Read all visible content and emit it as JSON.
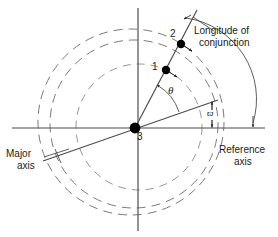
{
  "figure": {
    "type": "orbital-geometry-diagram",
    "colors": {
      "line": "#4d4d4d",
      "dash": "#6e6e6e",
      "text": "#1a1a1a",
      "marker": "#000000",
      "background": "#ffffff"
    }
  },
  "labels": {
    "point_1": "1",
    "point_2": "2",
    "point_3": "3",
    "theta": "θ",
    "omega_bar": "ϖ",
    "longitude_of_conjunction_line1": "Longitude of",
    "longitude_of_conjunction_line2": "conjunction",
    "reference_axis_line1": "Reference",
    "reference_axis_line2": "axis",
    "major_axis_line1": "Major",
    "major_axis_line2": "axis"
  },
  "geometry": {
    "center": {
      "x": 135,
      "y": 128
    },
    "reference_axis": {
      "x1": 12,
      "y1": 128,
      "x2": 265,
      "y2": 128
    },
    "vertical_axis": {
      "x1": 138,
      "y1": 8,
      "x2": 138,
      "y2": 230
    },
    "major_axis": {
      "x1": 45,
      "y1": 160,
      "x2": 216,
      "y2": 101
    },
    "conjunction_ray": {
      "x1": 135,
      "y1": 128,
      "x2": 196,
      "y2": 12
    },
    "orbit_outer": {
      "cx": 131,
      "cy": 122,
      "r": 93
    },
    "orbit_inner": {
      "cx": 134,
      "cy": 124,
      "r": 84
    },
    "orbit_small": {
      "cx": 138,
      "cy": 126,
      "r": 63
    },
    "marker_1": {
      "x": 165,
      "y": 73
    },
    "marker_2": {
      "x": 180,
      "y": 45
    },
    "theta_arc_radius": 46,
    "omega_arc_radius": 78
  }
}
